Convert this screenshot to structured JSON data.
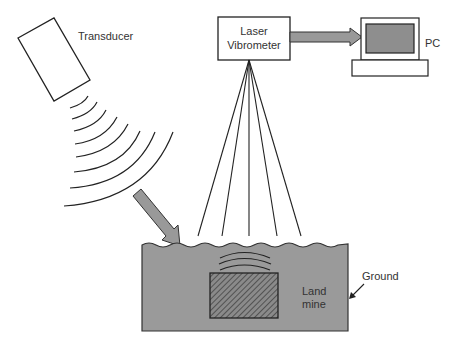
{
  "diagram": {
    "labels": {
      "transducer": "Transducer",
      "laser_line1": "Laser",
      "laser_line2": "Vibrometer",
      "pc": "PC",
      "ground": "Ground",
      "landmine_line1": "Land",
      "landmine_line2": "mine"
    },
    "colors": {
      "stroke": "#222222",
      "ground_fill": "#9a9a9a",
      "arrow_fill": "#999999",
      "screen_fill": "#8e8e8e",
      "background": "#ffffff"
    },
    "components": [
      {
        "id": "transducer",
        "label": "Transducer"
      },
      {
        "id": "acoustic-waves",
        "count": 8
      },
      {
        "id": "laser-vibrometer",
        "label": "Laser Vibrometer"
      },
      {
        "id": "pc",
        "label": "PC"
      },
      {
        "id": "laser-beams",
        "count": 5
      },
      {
        "id": "ground",
        "label": "Ground"
      },
      {
        "id": "landmine",
        "label": "Land mine"
      }
    ]
  }
}
